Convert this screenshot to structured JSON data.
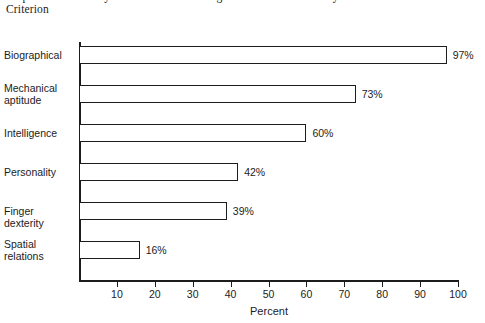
{
  "title": {
    "line1": "Proportion of Validity Coefficients .30 or Higher with Job Proficiency as the",
    "line2": "Criterion"
  },
  "chart_data": {
    "type": "bar",
    "orientation": "horizontal",
    "title": "Proportion of Validity Coefficients .30 or Higher with Job Proficiency as the Criterion",
    "xlabel": "Percent",
    "ylabel": "",
    "xlim": [
      0,
      100
    ],
    "xticks": [
      10,
      20,
      30,
      40,
      50,
      60,
      70,
      80,
      90,
      100
    ],
    "xticklabels": [
      "10",
      "20",
      "30",
      "40",
      "50",
      "60",
      "70",
      "80",
      "90",
      "100"
    ],
    "grid": false,
    "legend": false,
    "categories": [
      "Biographical",
      "Mechanical aptitude",
      "Intelligence",
      "Personality",
      "Finger dexterity",
      "Spatial relations"
    ],
    "category_lines": [
      [
        "Biographical"
      ],
      [
        "Mechanical",
        "aptitude"
      ],
      [
        "Intelligence"
      ],
      [
        "Personality"
      ],
      [
        "Finger dexterity"
      ],
      [
        "Spatial",
        "relations"
      ]
    ],
    "values": [
      97,
      73,
      60,
      42,
      39,
      16
    ],
    "value_labels": [
      "97%",
      "73%",
      "60%",
      "42%",
      "39%",
      "16%"
    ],
    "bar_fill": "#ffffff",
    "bar_edge": "#1c1c1c",
    "axis_color": "#1c1c1c",
    "background": "#ffffff"
  }
}
